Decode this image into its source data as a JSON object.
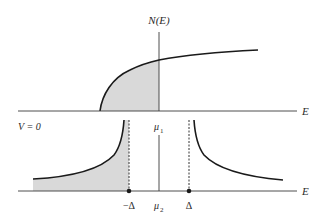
{
  "figure": {
    "labels": {
      "y_axis": "N(E)",
      "top_x_axis": "E",
      "bottom_x_axis": "E",
      "bias": "V = 0",
      "mu1": "μ",
      "mu1_sub": "1",
      "mu2": "μ",
      "mu2_sub": "2",
      "minus_gap": "−Δ",
      "gap": "Δ"
    },
    "colors": {
      "line": "#1a1a1a",
      "shade": "#d9d9d9",
      "axis": "#3a3a3a",
      "dotted": "#333333"
    },
    "panels": [
      {
        "name": "normal-metal",
        "curve": "square-root DOS starting at band edge, occupied states shaded up to μ1"
      },
      {
        "name": "superconductor",
        "curve": "BCS DOS with gap between −Δ and Δ, occupied states shaded below −Δ"
      }
    ]
  }
}
